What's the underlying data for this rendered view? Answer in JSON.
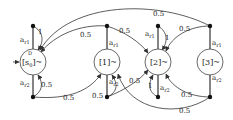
{
  "diagram": {
    "type": "markov-decision-process",
    "states": [
      {
        "id": "s0",
        "label": "[s̄₀]~",
        "label_main": "[s",
        "label_sub": "0",
        "label_sup": "D",
        "label_end": "]~",
        "initial": true
      },
      {
        "id": "s1",
        "label": "[1]~"
      },
      {
        "id": "s2",
        "label": "[2]~"
      },
      {
        "id": "s3",
        "label": "[3]~"
      }
    ],
    "actions": [
      {
        "from": "s0",
        "label": "a_r1",
        "text": "a",
        "sub": "r1"
      },
      {
        "from": "s0",
        "label": "a_r2",
        "text": "a",
        "sub": "r2"
      },
      {
        "from": "s1",
        "label": "a_r1",
        "text": "a",
        "sub": "r1"
      },
      {
        "from": "s1",
        "label": "a_r2",
        "text": "a",
        "sub": "r2"
      },
      {
        "from": "s2",
        "label": "a_r1",
        "text": "a",
        "sub": "r1"
      },
      {
        "from": "s2",
        "label": "a_r2",
        "text": "a",
        "sub": "r2"
      },
      {
        "from": "s3",
        "label": "a_r1",
        "text": "a",
        "sub": "r1"
      },
      {
        "from": "s3",
        "label": "a_r2",
        "text": "a",
        "sub": "r2"
      }
    ],
    "probabilities": {
      "s0_r1_self": "1",
      "s0_r2_self": "0.5",
      "s0_r2_to_s1": "0.5",
      "s1_r1_to_s0": "0.5",
      "s1_r1_to_s2": "0.5",
      "s1_r2_self": "0.5",
      "s1_r2_to_s2": "0.5",
      "s2_r1_self": "1",
      "s2_r2_self": "1",
      "s3_r1_to_s0": "0.5",
      "s3_r1_to_s2": "0.5",
      "s3_r2_to_s2": "0.5",
      "s3_r2_to_s1": "0.5"
    }
  }
}
